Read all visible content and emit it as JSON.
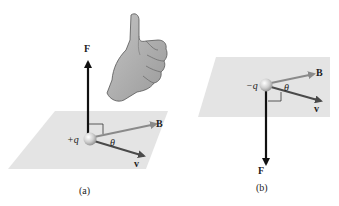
{
  "panels": [
    {
      "caption": "(a)",
      "charge_label": "+q",
      "force_label": "F",
      "field_label": "B",
      "velocity_label": "v",
      "angle_label": "θ",
      "hand": "thumbs-up-right-hand"
    },
    {
      "caption": "(b)",
      "charge_label": "−q",
      "force_label": "F",
      "field_label": "B",
      "velocity_label": "v",
      "angle_label": "θ"
    }
  ],
  "colors": {
    "plane": "#e4e4e4",
    "force_arrow": "#111111",
    "field_arrow": "#8a8a8a",
    "velocity_arrow": "#4a4a4a",
    "sphere": "#c8c8c8",
    "hand": "#a9a9a9"
  }
}
